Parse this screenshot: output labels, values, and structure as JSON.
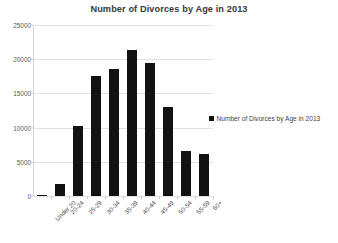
{
  "chart_data": {
    "type": "bar",
    "title": "Number of Divorces by Age in 2013",
    "xlabel": "",
    "ylabel": "",
    "categories": [
      "Under 20",
      "20-24",
      "25-29",
      "30-34",
      "35-39",
      "40-44",
      "45-49",
      "50-54",
      "55-59",
      "60+"
    ],
    "values": [
      100,
      1800,
      10200,
      17500,
      18500,
      21300,
      19500,
      13000,
      6600,
      6200
    ],
    "series": [
      {
        "name": "Number of Divorces by Age in 2013",
        "values": [
          100,
          1800,
          10200,
          17500,
          18500,
          21300,
          19500,
          13000,
          6600,
          6200
        ]
      }
    ],
    "ylim": [
      0,
      25000
    ],
    "ytick_labels": [
      "0",
      "5000",
      "10000",
      "15000",
      "20000",
      "25000"
    ],
    "ytick_values": [
      0,
      5000,
      10000,
      15000,
      20000,
      25000
    ],
    "grid": true,
    "legend_position": "right",
    "legend_entries": [
      "Number of Divorces by Age in 2013"
    ],
    "bar_color": "#121212",
    "gridline_color": "#e2e2e2"
  },
  "legend": {
    "label": "Number of Divorces by Age in 2013",
    "swatch_name": "legend-color-swatch"
  }
}
